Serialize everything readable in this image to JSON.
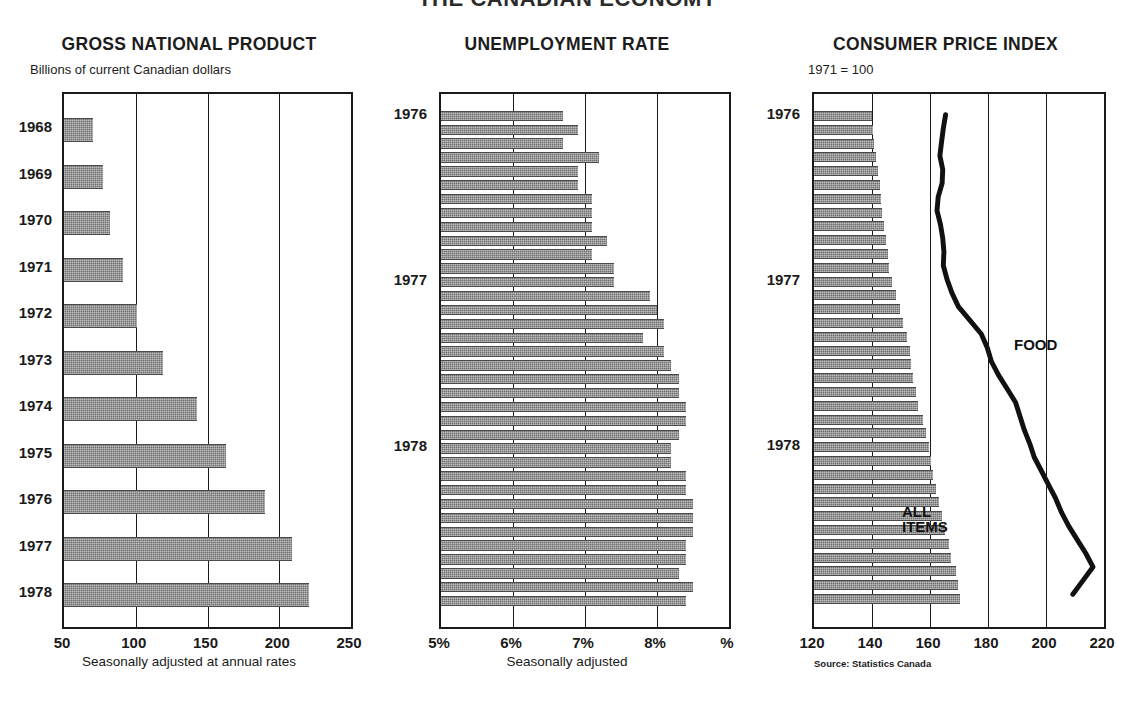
{
  "main_title": "THE CANADIAN ECONOMY",
  "panels": {
    "gnp": {
      "title": "GROSS NATIONAL PRODUCT",
      "subtitle": "Billions of current Canadian dollars",
      "xcaption": "Seasonally adjusted at annual rates"
    },
    "unemployment": {
      "title": "UNEMPLOYMENT RATE",
      "xcaption": "Seasonally adjusted"
    },
    "cpi": {
      "title": "CONSUMER PRICE INDEX",
      "subtitle": "1971 = 100",
      "source": "Source: Statistics Canada",
      "label_food": "FOOD",
      "label_all_items": "ALL\nITEMS"
    }
  },
  "colors": {
    "bar_fill": "#6e6e6e",
    "axis": "#1a1a1a",
    "line": "#111111",
    "background": "#ffffff"
  },
  "chart_data": [
    {
      "type": "bar",
      "orientation": "horizontal",
      "title": "GROSS NATIONAL PRODUCT",
      "subtitle": "Billions of current Canadian dollars",
      "xlabel": "Seasonally adjusted at annual rates",
      "ylabel": "",
      "xlim": [
        50,
        250
      ],
      "xticks": [
        50,
        100,
        150,
        200,
        250
      ],
      "xticklabels": [
        "50",
        "100",
        "150",
        "200",
        "250"
      ],
      "grid": true,
      "categories": [
        "1968",
        "1969",
        "1970",
        "1971",
        "1972",
        "1973",
        "1974",
        "1975",
        "1976",
        "1977",
        "1978"
      ],
      "values": [
        70,
        77,
        82,
        91,
        101,
        119,
        143,
        163,
        190,
        209,
        221
      ]
    },
    {
      "type": "bar",
      "orientation": "horizontal",
      "title": "UNEMPLOYMENT RATE",
      "subtitle": "",
      "xlabel": "Seasonally adjusted",
      "ylabel": "",
      "xlim": [
        5,
        9
      ],
      "xticks": [
        5,
        6,
        7,
        8,
        9
      ],
      "xticklabels": [
        "5%",
        "6%",
        "7%",
        "8%",
        "%"
      ],
      "grid": true,
      "year_markers": [
        {
          "label": "1976",
          "index": 0
        },
        {
          "label": "1977",
          "index": 12
        },
        {
          "label": "1978",
          "index": 24
        }
      ],
      "categories": [
        "1976-01",
        "1976-02",
        "1976-03",
        "1976-04",
        "1976-05",
        "1976-06",
        "1976-07",
        "1976-08",
        "1976-09",
        "1976-10",
        "1976-11",
        "1976-12",
        "1977-01",
        "1977-02",
        "1977-03",
        "1977-04",
        "1977-05",
        "1977-06",
        "1977-07",
        "1977-08",
        "1977-09",
        "1977-10",
        "1977-11",
        "1977-12",
        "1978-01",
        "1978-02",
        "1978-03",
        "1978-04",
        "1978-05",
        "1978-06",
        "1978-07",
        "1978-08",
        "1978-09",
        "1978-10",
        "1978-11",
        "1978-12"
      ],
      "values": [
        6.7,
        6.9,
        6.7,
        7.2,
        6.9,
        6.9,
        7.1,
        7.1,
        7.1,
        7.3,
        7.1,
        7.4,
        7.4,
        7.9,
        8.0,
        8.1,
        7.8,
        8.1,
        8.2,
        8.3,
        8.3,
        8.4,
        8.4,
        8.3,
        8.2,
        8.2,
        8.4,
        8.4,
        8.5,
        8.5,
        8.5,
        8.4,
        8.4,
        8.3,
        8.5,
        8.4
      ]
    },
    {
      "type": "bar",
      "orientation": "horizontal",
      "title": "CONSUMER PRICE INDEX",
      "subtitle": "1971 = 100",
      "source": "Source: Statistics Canada",
      "xlim": [
        120,
        220
      ],
      "xticks": [
        120,
        140,
        160,
        180,
        200,
        220
      ],
      "xticklabels": [
        "120",
        "140",
        "160",
        "180",
        "200",
        "220"
      ],
      "grid": true,
      "year_markers": [
        {
          "label": "1976",
          "index": 0
        },
        {
          "label": "1977",
          "index": 12
        },
        {
          "label": "1978",
          "index": 24
        }
      ],
      "categories": [
        "1976-01",
        "1976-02",
        "1976-03",
        "1976-04",
        "1976-05",
        "1976-06",
        "1976-07",
        "1976-08",
        "1976-09",
        "1976-10",
        "1976-11",
        "1976-12",
        "1977-01",
        "1977-02",
        "1977-03",
        "1977-04",
        "1977-05",
        "1977-06",
        "1977-07",
        "1977-08",
        "1977-09",
        "1977-10",
        "1977-11",
        "1977-12",
        "1978-01",
        "1978-02",
        "1978-03",
        "1978-04",
        "1978-05",
        "1978-06",
        "1978-07",
        "1978-08",
        "1978-09",
        "1978-10",
        "1978-11",
        "1978-12"
      ],
      "series": [
        {
          "name": "ALL ITEMS",
          "render": "bar",
          "values": [
            140.0,
            140.3,
            140.8,
            141.4,
            142.0,
            142.6,
            143.2,
            143.3,
            144.2,
            144.9,
            145.4,
            146.0,
            147.0,
            148.2,
            149.5,
            150.8,
            152.0,
            153.0,
            153.6,
            154.3,
            155.0,
            155.8,
            157.5,
            158.6,
            159.5,
            160.4,
            161.2,
            162.2,
            163.1,
            164.0,
            165.3,
            166.4,
            167.4,
            169.0,
            169.8,
            170.5
          ]
        },
        {
          "name": "FOOD",
          "render": "line",
          "values": [
            166.0,
            165.2,
            164.6,
            164.0,
            165.0,
            164.8,
            163.4,
            163.0,
            164.2,
            165.0,
            165.4,
            165.2,
            166.5,
            168.2,
            170.5,
            174.5,
            178.5,
            180.6,
            182.0,
            184.5,
            187.5,
            190.5,
            192.0,
            193.5,
            195.4,
            197.0,
            199.5,
            202.0,
            204.5,
            206.5,
            209.0,
            212.0,
            215.0,
            217.5,
            214.0,
            210.5
          ]
        }
      ]
    }
  ]
}
